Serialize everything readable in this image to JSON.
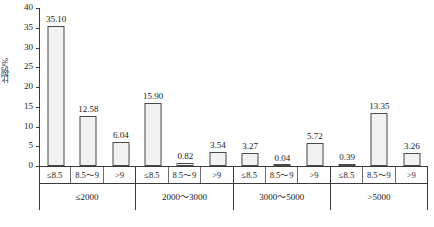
{
  "chart_data": {
    "type": "bar",
    "title": "",
    "xlabel": "",
    "ylabel": "比例/%",
    "ylim": [
      0,
      40
    ],
    "yticks": [
      0,
      5,
      10,
      15,
      20,
      25,
      30,
      35,
      40
    ],
    "ytick_labels": [
      "0",
      "5",
      "10",
      "15",
      "20",
      "25",
      "30",
      "35",
      "40"
    ],
    "grid": false,
    "legend": "none",
    "group_label_row": [
      "≤2000",
      "2000～3000",
      "3000～5000",
      ">5000"
    ],
    "sub_categories": [
      "≤8.5",
      "8.5～9",
      ">9"
    ],
    "categories": [
      "≤2000 / ≤8.5",
      "≤2000 / 8.5～9",
      "≤2000 / >9",
      "2000～3000 / ≤8.5",
      "2000～3000 / 8.5～9",
      "2000～3000 / >9",
      "3000～5000 / ≤8.5",
      "3000～5000 / 8.5～9",
      "3000～5000 / >9",
      ">5000 / ≤8.5",
      ">5000 / 8.5～9",
      ">5000 / >9"
    ],
    "values": [
      35.1,
      12.58,
      6.04,
      15.9,
      0.82,
      3.54,
      3.27,
      0.04,
      5.72,
      0.39,
      13.35,
      3.26
    ],
    "value_labels": [
      "35.10",
      "12.58",
      "6.04",
      "15.90",
      "0.82",
      "3.54",
      "3.27",
      "0.04",
      "5.72",
      "0.39",
      "13.35",
      "3.26"
    ],
    "groups": [
      {
        "label": "≤2000",
        "bars": [
          {
            "sub": "≤8.5",
            "value": 35.1,
            "label": "35.10"
          },
          {
            "sub": "8.5～9",
            "value": 12.58,
            "label": "12.58"
          },
          {
            "sub": ">9",
            "value": 6.04,
            "label": "6.04"
          }
        ]
      },
      {
        "label": "2000～3000",
        "bars": [
          {
            "sub": "≤8.5",
            "value": 15.9,
            "label": "15.90"
          },
          {
            "sub": "8.5～9",
            "value": 0.82,
            "label": "0.82"
          },
          {
            "sub": ">9",
            "value": 3.54,
            "label": "3.54"
          }
        ]
      },
      {
        "label": "3000～5000",
        "bars": [
          {
            "sub": "≤8.5",
            "value": 3.27,
            "label": "3.27"
          },
          {
            "sub": "8.5～9",
            "value": 0.04,
            "label": "0.04"
          },
          {
            "sub": ">9",
            "value": 5.72,
            "label": "5.72"
          }
        ]
      },
      {
        "label": ">5000",
        "bars": [
          {
            "sub": "≤8.5",
            "value": 0.39,
            "label": "0.39"
          },
          {
            "sub": "8.5～9",
            "value": 13.35,
            "label": "13.35"
          },
          {
            "sub": ">9",
            "value": 3.26,
            "label": "3.26"
          }
        ]
      }
    ],
    "colors": {
      "bar_fill": "#f2f2f2",
      "bar_border": "#4a4a4a",
      "axis": "#3a3a3a",
      "text": "#1a1a1a",
      "background": "#ffffff"
    }
  }
}
